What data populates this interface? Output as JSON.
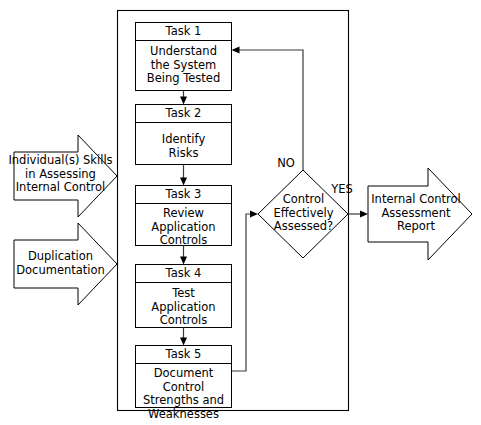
{
  "diagram": {
    "colors": {
      "stroke": "#000000",
      "connector": "#3a3a3a",
      "background": "#ffffff"
    },
    "tasks": [
      {
        "id": "task-1",
        "header": "Task 1",
        "body": "Understand\nthe System\nBeing Tested"
      },
      {
        "id": "task-2",
        "header": "Task 2",
        "body": "Identify\nRisks"
      },
      {
        "id": "task-3",
        "header": "Task 3",
        "body": "Review\nApplication\nControls"
      },
      {
        "id": "task-4",
        "header": "Task 4",
        "body": "Test\nApplication\nControls"
      },
      {
        "id": "task-5",
        "header": "Task 5",
        "body": "Document Control\nStrengths and\nWeaknesses"
      }
    ],
    "decision": {
      "id": "decision-control-assessed",
      "text": "Control\nEffectively\nAssessed?",
      "branch_no": "NO",
      "branch_yes": "YES"
    },
    "inputs": [
      {
        "id": "input-skills",
        "text": "Individual(s) Skills\nin Assessing\nInternal Control"
      },
      {
        "id": "input-documentation",
        "text": "Duplication\nDocumentation"
      }
    ],
    "output": {
      "id": "output-report",
      "text": "Internal Control\nAssessment\nReport"
    }
  }
}
